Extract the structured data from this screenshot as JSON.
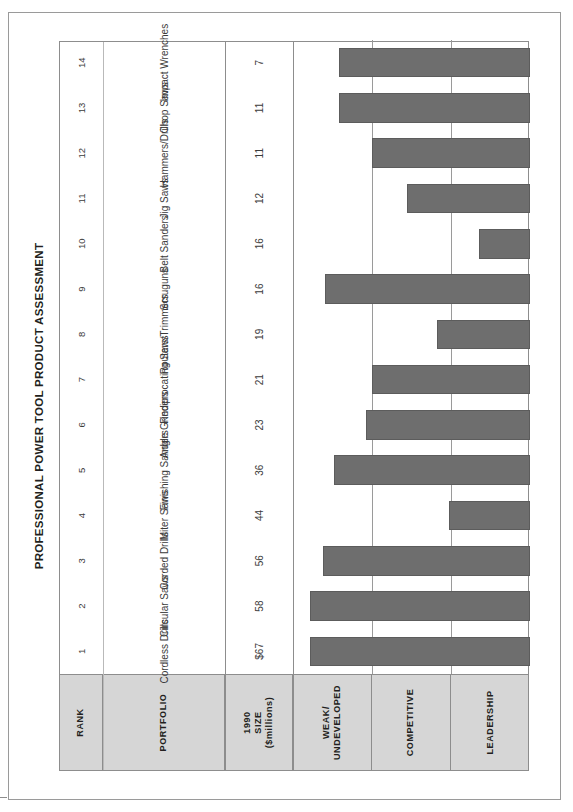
{
  "figure": {
    "title": "PROFESSIONAL POWER TOOL PRODUCT ASSESSMENT",
    "bar_color": "#6e6e6e",
    "header_fill": "#d6d6d6",
    "border_color": "#8d8d8d"
  },
  "columns": {
    "rank": "RANK",
    "portfolio": "PORTFOLIO",
    "size": "1990\nSIZE\n($millions)",
    "size_line1": "1990",
    "size_line2": "SIZE",
    "size_line3": "($millions)"
  },
  "zones": {
    "weak": "WEAK/\nUNDEVELOPED",
    "weak_line1": "WEAK/",
    "weak_line2": "UNDEVELOPED",
    "competitive": "COMPETITIVE",
    "leadership": "LEADERSHIP"
  },
  "chart_data": {
    "type": "bar",
    "title": "PROFESSIONAL POWER TOOL PRODUCT ASSESSMENT",
    "xlabel": "PORTFOLIO",
    "ylabel": "Competitive position",
    "orientation": "vertical-bars-rotated-page",
    "grid": true,
    "legend": null,
    "zone_bands": [
      {
        "label": "WEAK/ UNDEVELOPED",
        "from": 0,
        "to": 1
      },
      {
        "label": "COMPETITIVE",
        "from": 1,
        "to": 2
      },
      {
        "label": "LEADERSHIP",
        "from": 2,
        "to": 3
      }
    ],
    "ylim": [
      0,
      3
    ],
    "categories": [
      "Cordless Drills",
      "Circular Saws",
      "Corded Drills",
      "Miter Saws",
      "Finishing Sanders",
      "Angle Grinders",
      "Reciprocating Saws",
      "Routers/Trimmers",
      "Scruguns",
      "Belt Sanders",
      "Jig Saws",
      "Hammers/Drills",
      "Chop Saws",
      "Impact Wrenches"
    ],
    "ranks": [
      1,
      2,
      3,
      4,
      5,
      6,
      7,
      8,
      9,
      10,
      11,
      12,
      13,
      14
    ],
    "size_labels": [
      "$67",
      "58",
      "56",
      "44",
      "36",
      "23",
      "21",
      "19",
      "16",
      "16",
      "12",
      "11",
      "11",
      "7"
    ],
    "size_values": [
      67,
      58,
      56,
      44,
      36,
      23,
      21,
      19,
      16,
      16,
      12,
      11,
      11,
      7
    ],
    "values": [
      2.78,
      2.78,
      2.62,
      1.03,
      2.48,
      2.07,
      2.0,
      1.18,
      2.6,
      0.65,
      1.56,
      2.0,
      2.42,
      2.42
    ],
    "zone_of_bar": [
      "LEADERSHIP",
      "LEADERSHIP",
      "LEADERSHIP",
      "WEAK/UNDEVELOPED",
      "LEADERSHIP",
      "COMPETITIVE",
      "COMPETITIVE",
      "WEAK/UNDEVELOPED",
      "LEADERSHIP",
      "WEAK/UNDEVELOPED",
      "COMPETITIVE",
      "COMPETITIVE",
      "LEADERSHIP",
      "LEADERSHIP"
    ]
  }
}
